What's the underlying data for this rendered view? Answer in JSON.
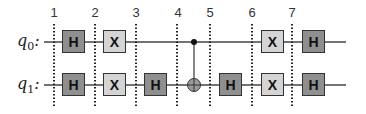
{
  "diagram": {
    "type": "quantum-circuit",
    "qubits": [
      {
        "id": "q0",
        "label": "q",
        "sub": "0",
        "suffix": ":"
      },
      {
        "id": "q1",
        "label": "q",
        "sub": "1",
        "suffix": ":"
      }
    ],
    "columns": [
      "1",
      "2",
      "3",
      "4",
      "5",
      "6",
      "7"
    ],
    "gates": [
      {
        "qubit": "q0",
        "name": "H",
        "kind": "h",
        "col": 1
      },
      {
        "qubit": "q0",
        "name": "X",
        "kind": "x",
        "col": 2
      },
      {
        "qubit": "q1",
        "name": "H",
        "kind": "h",
        "col": 1
      },
      {
        "qubit": "q1",
        "name": "X",
        "kind": "x",
        "col": 2
      },
      {
        "qubit": "q1",
        "name": "H",
        "kind": "h",
        "col": 3
      },
      {
        "control": "q0",
        "target": "q1",
        "name": "CNOT",
        "col": 4
      },
      {
        "qubit": "q1",
        "name": "H",
        "kind": "h",
        "col": 5
      },
      {
        "qubit": "q0",
        "name": "X",
        "kind": "x",
        "col": 6
      },
      {
        "qubit": "q1",
        "name": "X",
        "kind": "x",
        "col": 6
      },
      {
        "qubit": "q0",
        "name": "H",
        "kind": "h",
        "col": 7
      },
      {
        "qubit": "q1",
        "name": "H",
        "kind": "h",
        "col": 7
      }
    ],
    "colors": {
      "h_gate": "#8f8f8f",
      "x_gate": "#d4d4d4",
      "wire": "#444444"
    }
  }
}
